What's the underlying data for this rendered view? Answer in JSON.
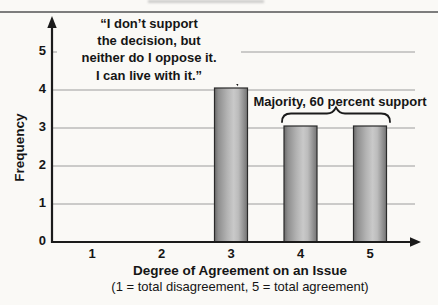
{
  "figure": {
    "kind": "scanned textbook bar graph"
  },
  "colors": {
    "background": "#faf9f6",
    "text": "#151515",
    "axis": "#1b1b1b",
    "grid": "#9c9c9c",
    "rule": "#7d7d7d",
    "smudge": "#969696",
    "bar_border": "#2a2a2a",
    "bar_gradient": [
      "#6b6b6b",
      "#8f8f8f",
      "#b3b3b3",
      "#c9c9c9",
      "#bcbcbc",
      "#8d8d8d",
      "#757575"
    ]
  },
  "chart_data": {
    "type": "bar",
    "categories": [
      "1",
      "2",
      "3",
      "4",
      "5"
    ],
    "values": [
      0,
      0,
      4,
      3,
      3
    ],
    "ylabel": "Frequency",
    "xlabel": "Degree of Agreement on an Issue",
    "xlabel_note": "(1 = total disagreement, 5 = total agreement)",
    "ylim": [
      0,
      5
    ],
    "yticks": [
      "0",
      "1",
      "2",
      "3",
      "4",
      "5"
    ],
    "grid": "horizontal",
    "legend": "none",
    "annotations": {
      "quote": {
        "text": "“I don’t support\nthe decision, but\nneither do I oppose it.\nI can live with it.”",
        "points_to_category": "3"
      },
      "majority": {
        "text": "Majority, 60 percent support",
        "brace_categories": [
          "4",
          "5"
        ]
      }
    }
  }
}
